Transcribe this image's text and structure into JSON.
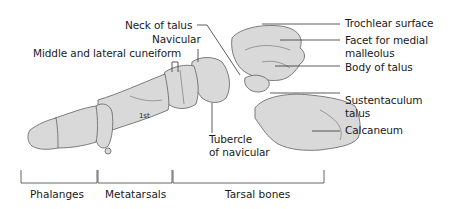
{
  "diagram": {
    "colors": {
      "bone_fill": "#d9d9d9",
      "bone_outline": "#6e6e6e",
      "leader": "#333333",
      "text": "#1a1a1a"
    },
    "labels": {
      "neck_of_talus": "Neck of talus",
      "navicular": "Navicular",
      "cuneiform": "Middle and lateral cuneiform",
      "trochlear_surface": "Trochlear surface",
      "facet_line1": "Facet for medial",
      "facet_line2": "malleolus",
      "body_of_talus": "Body of talus",
      "sustentaculum_line1": "Sustentaculum",
      "sustentaculum_line2": "talus",
      "calcaneum": "Calcaneum",
      "tubercle_line1": "Tubercle",
      "tubercle_line2": "of navicular",
      "first_metatarsal": "1st"
    },
    "groups": [
      {
        "label": "Phalanges"
      },
      {
        "label": "Metatarsals"
      },
      {
        "label": "Tarsal bones"
      }
    ]
  }
}
